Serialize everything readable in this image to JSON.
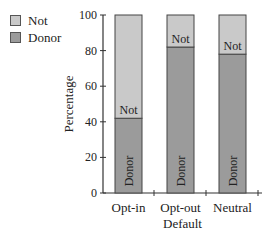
{
  "chart_data": {
    "type": "bar",
    "stacked": true,
    "title": "",
    "xlabel": "Default",
    "ylabel": "Percentage",
    "ylim": [
      0,
      100
    ],
    "yticks": [
      0,
      20,
      40,
      60,
      80,
      100
    ],
    "grid": false,
    "legend_position": "top-left",
    "categories": [
      "Opt-in",
      "Opt-out",
      "Neutral"
    ],
    "series": [
      {
        "name": "Donor",
        "values": [
          42,
          82,
          78
        ],
        "color": "#9b9b9b",
        "bar_label": "Donor"
      },
      {
        "name": "Not",
        "values": [
          58,
          18,
          22
        ],
        "color": "#c9c9c9",
        "bar_label": "Not"
      }
    ]
  },
  "legend": {
    "items": [
      {
        "label": "Not",
        "color": "#c9c9c9"
      },
      {
        "label": "Donor",
        "color": "#9b9b9b"
      }
    ]
  }
}
